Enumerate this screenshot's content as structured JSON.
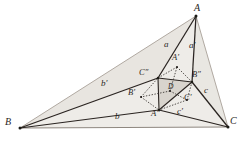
{
  "figure": {
    "type": "geometry-diagram",
    "canvas": {
      "width": 245,
      "height": 146
    },
    "colors": {
      "stroke_dark": "#241f1c",
      "stroke_mid": "#4a443f",
      "stroke_light": "#9a938c",
      "fill_outer": "#eceae6",
      "fill_inner": "#d9d5cf",
      "dotted": "#3a3430",
      "background": "#ffffff"
    },
    "vertices": [
      {
        "id": "A",
        "label": "A",
        "x": 196,
        "y": 16,
        "label_x": 194,
        "label_y": 5,
        "size": "vertex"
      },
      {
        "id": "B",
        "label": "B",
        "x": 20,
        "y": 128,
        "label_x": 6,
        "label_y": 118,
        "size": "vertex"
      },
      {
        "id": "C",
        "label": "C",
        "x": 228,
        "y": 127,
        "label_x": 230,
        "label_y": 118,
        "size": "vertex"
      },
      {
        "id": "Ap",
        "label": "A′",
        "x": 177,
        "y": 67,
        "label_x": 171,
        "label_y": 54,
        "size": "vertex2"
      },
      {
        "id": "Bp",
        "label": "B′",
        "x": 141,
        "y": 97,
        "label_x": 129,
        "label_y": 89,
        "size": "vertex2"
      },
      {
        "id": "Cp",
        "label": "C′",
        "x": 187,
        "y": 100,
        "label_x": 185,
        "label_y": 94,
        "size": "vertex2"
      },
      {
        "id": "App",
        "label": "A″",
        "x": 159,
        "y": 110,
        "label_x": 152,
        "label_y": 110,
        "size": "vertex2"
      },
      {
        "id": "Bpp",
        "label": "B″",
        "x": 192,
        "y": 82,
        "label_x": 192,
        "label_y": 72,
        "size": "vertex2"
      },
      {
        "id": "Cpp",
        "label": "C″",
        "x": 158,
        "y": 78,
        "label_x": 141,
        "label_y": 69,
        "size": "vertex2"
      },
      {
        "id": "D",
        "label": "D",
        "x": 170,
        "y": 91,
        "label_x": 167,
        "label_y": 84,
        "size": "small"
      }
    ],
    "side_labels": [
      {
        "id": "a",
        "label": "a",
        "x": 166,
        "y": 45
      },
      {
        "id": "aprime",
        "label": "a′",
        "x": 191,
        "y": 46
      },
      {
        "id": "bprime",
        "label": "b′",
        "x": 103,
        "y": 84
      },
      {
        "id": "b",
        "label": "b",
        "x": 116,
        "y": 116
      },
      {
        "id": "c",
        "label": "c",
        "x": 205,
        "y": 91
      },
      {
        "id": "cprime",
        "label": "c′",
        "x": 178,
        "y": 111
      }
    ],
    "segments": [
      {
        "id": "A-B",
        "from": "A",
        "to": "B",
        "style": "light"
      },
      {
        "id": "A-C",
        "from": "A",
        "to": "C",
        "style": "light"
      },
      {
        "id": "B-C",
        "from": "B",
        "to": "C",
        "style": "light"
      },
      {
        "id": "B-Cpp",
        "from": "B",
        "to": "Cpp",
        "style": "dark"
      },
      {
        "id": "Cpp-A",
        "from": "Cpp",
        "to": "A",
        "style": "dark"
      },
      {
        "id": "B-App",
        "from": "B",
        "to": "App",
        "style": "dark"
      },
      {
        "id": "App-C",
        "from": "App",
        "to": "C",
        "style": "dark"
      },
      {
        "id": "A-Bpp",
        "from": "A",
        "to": "Bpp",
        "style": "dark"
      },
      {
        "id": "Bpp-C",
        "from": "Bpp",
        "to": "C",
        "style": "dark"
      },
      {
        "id": "Cpp-Bpp",
        "from": "Cpp",
        "to": "Bpp",
        "style": "dark"
      },
      {
        "id": "Bpp-App",
        "from": "Bpp",
        "to": "App",
        "style": "dark"
      },
      {
        "id": "App-Cpp",
        "from": "App",
        "to": "Cpp",
        "style": "dark"
      },
      {
        "id": "D-Ap",
        "from": "D",
        "to": "Ap",
        "style": "dotted"
      },
      {
        "id": "D-Bp",
        "from": "D",
        "to": "Bp",
        "style": "dotted"
      },
      {
        "id": "D-Cp",
        "from": "D",
        "to": "Cp",
        "style": "dotted"
      },
      {
        "id": "Ap-Cpp",
        "from": "Ap",
        "to": "Cpp",
        "style": "dotted"
      },
      {
        "id": "Ap-Bpp",
        "from": "Ap",
        "to": "Bpp",
        "style": "dotted"
      },
      {
        "id": "Bp-Cpp",
        "from": "Bp",
        "to": "Cpp",
        "style": "dotted"
      },
      {
        "id": "Bp-App",
        "from": "Bp",
        "to": "App",
        "style": "dotted"
      },
      {
        "id": "Cp-App",
        "from": "Cp",
        "to": "App",
        "style": "dotted"
      },
      {
        "id": "Cp-Bpp",
        "from": "Cp",
        "to": "Bpp",
        "style": "dotted"
      }
    ]
  }
}
